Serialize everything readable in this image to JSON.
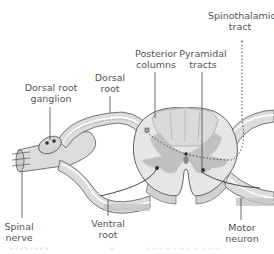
{
  "diagram": {
    "labels": {
      "spinothalamic_tract": [
        "Spinothalamic",
        "tract"
      ],
      "posterior_columns": [
        "Posterior",
        "columns"
      ],
      "pyramidal_tracts": [
        "Pyramidal",
        "tracts"
      ],
      "dorsal_root": [
        "Dorsal",
        "root"
      ],
      "dorsal_root_ganglion": [
        "Dorsal root",
        "ganglion"
      ],
      "spinal_nerve": [
        "Spinal",
        "nerve"
      ],
      "ventral_root": [
        "Ventral",
        "root"
      ],
      "motor_neuron": [
        "Motor",
        "neuron"
      ]
    },
    "colors": {
      "white_matter": "#e6e6e6",
      "grey_matter": "#bdbdbd",
      "posterior_columns_fill": "#d9d9d9",
      "nerve_fill": "#dcdcdc",
      "outline": "#555555",
      "label_text": "#555555",
      "leader_line": "#444444"
    }
  }
}
